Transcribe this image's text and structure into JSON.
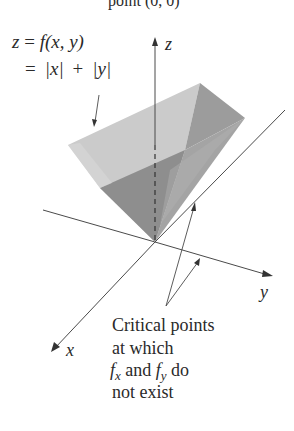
{
  "figure": {
    "top_caption_fragment": "point (0, 0)",
    "function_label": {
      "line1": "z = f(x, y)",
      "line1_parts": {
        "z": "z",
        "eq": " = ",
        "f": "f",
        "args": "(x, y)"
      },
      "line2": "= |x| + |y|",
      "line2_parts": {
        "eq": "=",
        "absx": "|x|",
        "plus": "+",
        "absy": "|y|"
      }
    },
    "axes": {
      "z_label": "z",
      "y_label": "y",
      "x_label": "x"
    },
    "annotation": {
      "lines": [
        "Critical points",
        "at which",
        "and",
        "do",
        "not exist"
      ],
      "fx_base": "f",
      "fx_sub": "x",
      "fy_base": "f",
      "fy_sub": "y",
      "line3_and": " and ",
      "line3_do": " do"
    },
    "colors": {
      "surface_light": "#c9c9c9",
      "surface_mid": "#a8a8a8",
      "surface_dark": "#8a8a8a",
      "surface_darkest": "#7a7a7a",
      "axis": "#4a4a4a",
      "text": "#2a2a2a"
    }
  }
}
